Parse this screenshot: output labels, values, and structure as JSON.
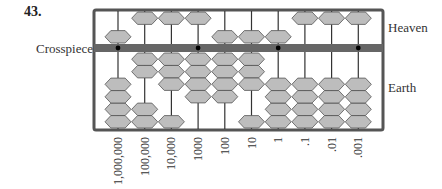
{
  "problem_number": "43.",
  "labels": {
    "crosspiece": "Crosspiece",
    "heaven": "Heaven",
    "earth": "Earth"
  },
  "colors": {
    "frame": "#555555",
    "crosspiece": "#666666",
    "bead_fill": "#bdbdbd",
    "bead_stroke": "#555555",
    "rod": "#333333",
    "dot": "#000000"
  },
  "rods": [
    {
      "place": "1,000,000",
      "heaven_down": true,
      "earth_up": 0,
      "digit": 5,
      "dot": true
    },
    {
      "place": "100,000",
      "heaven_down": false,
      "earth_up": 2,
      "digit": 2,
      "dot": false
    },
    {
      "place": "10,000",
      "heaven_down": false,
      "earth_up": 3,
      "digit": 3,
      "dot": false
    },
    {
      "place": "1000",
      "heaven_down": false,
      "earth_up": 4,
      "digit": 4,
      "dot": true
    },
    {
      "place": "100",
      "heaven_down": true,
      "earth_up": 4,
      "digit": 9,
      "dot": false
    },
    {
      "place": "10",
      "heaven_down": true,
      "earth_up": 3,
      "digit": 8,
      "dot": false
    },
    {
      "place": "1",
      "heaven_down": true,
      "earth_up": 0,
      "digit": 5,
      "dot": true
    },
    {
      "place": ".1",
      "heaven_down": false,
      "earth_up": 0,
      "digit": 0,
      "dot": false
    },
    {
      "place": ".01",
      "heaven_down": false,
      "earth_up": 0,
      "digit": 0,
      "dot": false
    },
    {
      "place": ".001",
      "heaven_down": false,
      "earth_up": 0,
      "digit": 0,
      "dot": true
    }
  ]
}
